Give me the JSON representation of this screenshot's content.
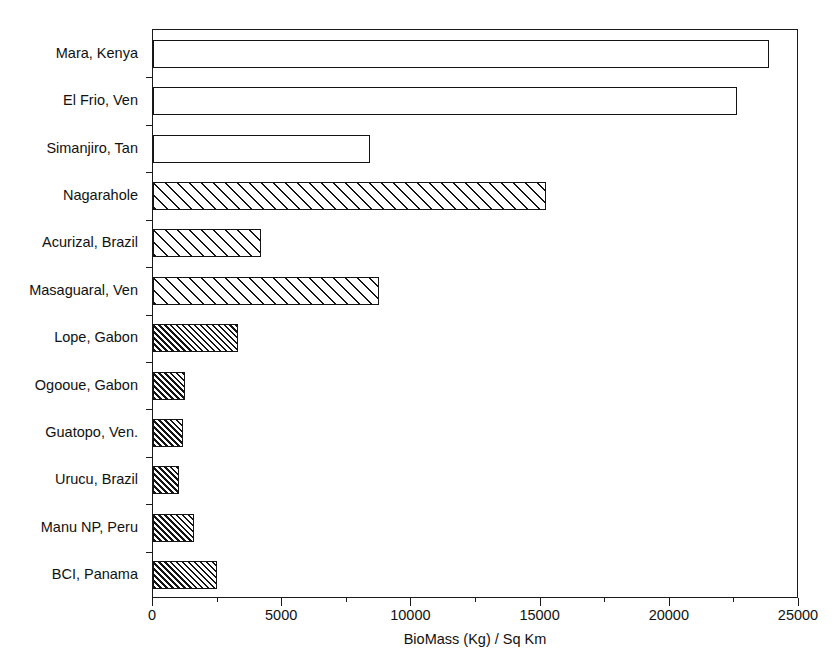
{
  "chart_data": {
    "type": "bar",
    "orientation": "horizontal",
    "title": "",
    "subtitle": "",
    "xlabel": "BioMass (Kg) / Sq Km",
    "ylabel": "",
    "xlim": [
      0,
      25000
    ],
    "xticks": [
      0,
      5000,
      10000,
      15000,
      20000,
      25000
    ],
    "xtick_labels": [
      "0",
      "5000",
      "10000",
      "15000",
      "20000",
      "25000"
    ],
    "grid": false,
    "legend": false,
    "legend_position": "none",
    "categories": [
      "Mara, Kenya",
      "El Frio, Ven",
      "Simanjiro, Tan",
      "Nagarahole",
      "Acurizal, Brazil",
      "Masaguaral, Ven",
      "Lope, Gabon",
      "Ogooue, Gabon",
      "Guatopo, Ven.",
      "Urucu, Brazil",
      "Manu NP, Peru",
      "BCI, Panama"
    ],
    "values": [
      23840,
      22600,
      8400,
      15200,
      4180,
      8750,
      3290,
      1240,
      1160,
      1010,
      1590,
      2480
    ],
    "bars": [
      {
        "category": "Mara, Kenya",
        "value": 23840,
        "fill": "none"
      },
      {
        "category": "El Frio, Ven",
        "value": 22600,
        "fill": "none"
      },
      {
        "category": "Simanjiro, Tan",
        "value": 8400,
        "fill": "none"
      },
      {
        "category": "Nagarahole",
        "value": 15200,
        "fill": "wide"
      },
      {
        "category": "Acurizal, Brazil",
        "value": 4180,
        "fill": "wide"
      },
      {
        "category": "Masaguaral, Ven",
        "value": 8750,
        "fill": "wide"
      },
      {
        "category": "Lope, Gabon",
        "value": 3290,
        "fill": "dense"
      },
      {
        "category": "Ogooue, Gabon",
        "value": 1240,
        "fill": "dense"
      },
      {
        "category": "Guatopo, Ven.",
        "value": 1160,
        "fill": "dense"
      },
      {
        "category": "Urucu, Brazil",
        "value": 1010,
        "fill": "dense"
      },
      {
        "category": "Manu NP, Peru",
        "value": 1590,
        "fill": "dense"
      },
      {
        "category": "BCI, Panama",
        "value": 2480,
        "fill": "dense"
      }
    ],
    "colors": {
      "axis": "#1a1a1a",
      "bar_outline": "#141414",
      "bar_face": "#ffffff",
      "hatch": "#141414",
      "background": "#ffffff",
      "text": "#111111"
    }
  }
}
